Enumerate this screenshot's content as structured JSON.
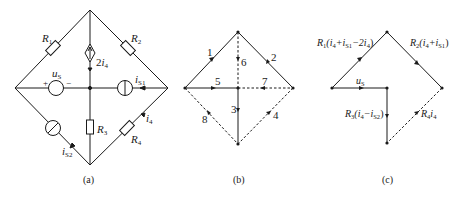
{
  "figure": {
    "panels": [
      {
        "id": "a",
        "caption": "(a)",
        "components": {
          "R1": {
            "label": "R",
            "sub": "1"
          },
          "R2": {
            "label": "R",
            "sub": "2"
          },
          "R3": {
            "label": "R",
            "sub": "3"
          },
          "R4": {
            "label": "R",
            "sub": "4"
          },
          "dep_source": {
            "coef": "2",
            "var": "i",
            "sub": "4"
          },
          "voltage_source": {
            "label": "u",
            "sub": "S",
            "plus": "+",
            "minus": "−"
          },
          "current_source_1": {
            "label": "i",
            "sub": "S1"
          },
          "current_source_2": {
            "label": "i",
            "sub": "S2"
          },
          "i4": {
            "label": "i",
            "sub": "4"
          }
        }
      },
      {
        "id": "b",
        "caption": "(b)",
        "branches": [
          "1",
          "2",
          "3",
          "4",
          "5",
          "6",
          "7",
          "8"
        ],
        "tree_branches": [
          "1",
          "2",
          "3",
          "5"
        ],
        "link_branches": [
          "4",
          "6",
          "7",
          "8"
        ]
      },
      {
        "id": "c",
        "caption": "(c)",
        "voltages": {
          "v1": {
            "R": "R",
            "sub": "1",
            "expr_a": "(i",
            "s1": "4",
            "expr_b": "+i",
            "s2": "S1",
            "expr_c": "−2i",
            "s3": "4",
            "expr_d": ")"
          },
          "v2": {
            "R": "R",
            "sub": "2",
            "expr_a": "(i",
            "s1": "4",
            "expr_b": "+i",
            "s2": "S1",
            "expr_d": ")"
          },
          "v5": {
            "label": "u",
            "sub": "S"
          },
          "v3": {
            "R": "R",
            "sub": "3",
            "expr_a": "(i",
            "s1": "4",
            "expr_b": "−i",
            "s2": "S2",
            "expr_d": ")"
          },
          "v4": {
            "R": "R",
            "sub": "4",
            "expr_a": "i",
            "s1": "4"
          }
        }
      }
    ]
  }
}
